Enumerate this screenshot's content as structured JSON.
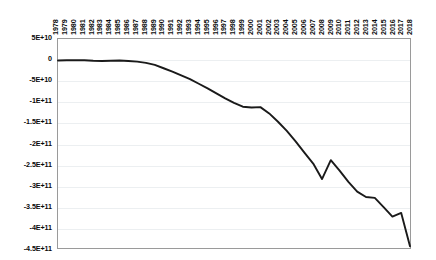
{
  "chart_data": {
    "type": "line",
    "title": "",
    "subtitle": "",
    "xlabel": "",
    "ylabel": "",
    "legend": [],
    "legend_position": "none",
    "grid": true,
    "grid_axis": "y",
    "line_color": "#1a1a1a",
    "plot_border_color": "#9a9a9a",
    "gridline_color": "#eceff1",
    "xlim": [
      1978,
      2018
    ],
    "ylim": [
      -450000000000,
      50000000000
    ],
    "ytick_labels": [
      "5E+10",
      "0",
      "-5E+10",
      "-1E+11",
      "-1.5E+11",
      "-2E+11",
      "-2.5E+11",
      "-3E+11",
      "-3.5E+11",
      "-4E+11",
      "-4.5E+11"
    ],
    "ytick_values": [
      50000000000,
      0,
      -50000000000,
      -100000000000,
      -150000000000,
      -200000000000,
      -250000000000,
      -300000000000,
      -350000000000,
      -400000000000,
      -450000000000
    ],
    "categories": [
      "1978",
      "1979",
      "1980",
      "1981",
      "1982",
      "1983",
      "1984",
      "1985",
      "1986",
      "1987",
      "1988",
      "1989",
      "1990",
      "1991",
      "1992",
      "1993",
      "1994",
      "1995",
      "1996",
      "1997",
      "1998",
      "1999",
      "2000",
      "2001",
      "2002",
      "2003",
      "2004",
      "2005",
      "2006",
      "2007",
      "2008",
      "2009",
      "2010",
      "2011",
      "2012",
      "2013",
      "2014",
      "2015",
      "2016",
      "2017",
      "2018"
    ],
    "values": [
      -1500000000,
      -1000000000,
      -500000000,
      -1000000000,
      -2000000000,
      -2500000000,
      -2000000000,
      -1500000000,
      -2500000000,
      -4000000000,
      -7000000000,
      -12000000000,
      -20000000000,
      -28000000000,
      -37000000000,
      -46000000000,
      -57000000000,
      -68000000000,
      -80000000000,
      -92000000000,
      -103000000000,
      -112000000000,
      -114000000000,
      -113000000000,
      -128000000000,
      -148000000000,
      -170000000000,
      -195000000000,
      -222000000000,
      -248000000000,
      -285000000000,
      -240000000000,
      -265000000000,
      -292000000000,
      -315000000000,
      -328000000000,
      -330000000000,
      -352000000000,
      -375000000000,
      -366000000000,
      -446000000000
    ]
  }
}
